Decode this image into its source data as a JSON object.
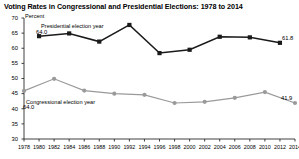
{
  "title": "Voting Rates in Congressional and Presidential Elections: 1978 to 2014",
  "axis_unit": "Percent",
  "labels": {
    "presidential_series": "Presidential election year",
    "congressional_series": "Congressional election year",
    "presidential_first_value": "64.0",
    "presidential_last_value": "61.8",
    "congressional_first_value": "64.0",
    "congressional_last_value": "41.9"
  },
  "colors": {
    "presidential": "#1a1a1a",
    "congressional": "#9a9a9a",
    "axis": "#2b2b2b",
    "background": "#ffffff"
  },
  "chart_data": {
    "type": "line",
    "title": "Voting Rates in Congressional and Presidential Elections: 1978 to 2014",
    "xlabel": "",
    "ylabel": "Percent",
    "ylim": [
      30,
      70
    ],
    "yticks": [
      30,
      35,
      40,
      45,
      50,
      55,
      60,
      65,
      70
    ],
    "xticks": [
      1978,
      1980,
      1982,
      1984,
      1986,
      1988,
      1990,
      1992,
      1994,
      1996,
      1998,
      2000,
      2002,
      2004,
      2006,
      2008,
      2010,
      2012,
      2014
    ],
    "grid": false,
    "legend": "inline-annotations",
    "series": [
      {
        "name": "Presidential election year",
        "marker": "square",
        "color": "#1a1a1a",
        "x": [
          1980,
          1984,
          1988,
          1992,
          1996,
          2000,
          2004,
          2008,
          2012
        ],
        "values": [
          64.0,
          64.9,
          62.2,
          67.7,
          58.4,
          59.5,
          63.8,
          63.6,
          61.8
        ]
      },
      {
        "name": "Congressional election year",
        "marker": "circle",
        "color": "#9a9a9a",
        "x": [
          1978,
          1982,
          1986,
          1990,
          1994,
          1998,
          2002,
          2006,
          2010,
          2014
        ],
        "values": [
          45.9,
          49.9,
          46.0,
          45.0,
          44.6,
          41.9,
          42.3,
          43.6,
          45.5,
          41.9
        ]
      }
    ],
    "annotations": [
      {
        "text": "Presidential election year",
        "series": "Presidential election year"
      },
      {
        "text": "64.0",
        "x": 1980,
        "series": "Presidential election year"
      },
      {
        "text": "61.8",
        "x": 2012,
        "series": "Presidential election year"
      },
      {
        "text": "Congressional election year",
        "series": "Congressional election year"
      },
      {
        "text": "64.0",
        "x": 1978,
        "series": "Congressional election year"
      },
      {
        "text": "41.9",
        "x": 2014,
        "series": "Congressional election year"
      }
    ]
  }
}
